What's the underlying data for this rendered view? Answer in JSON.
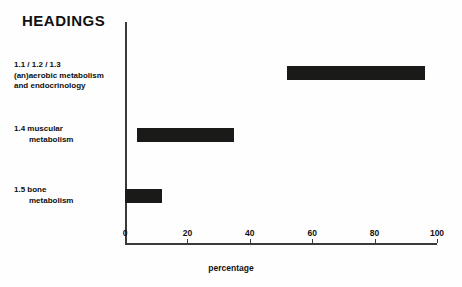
{
  "chart_data": {
    "type": "bar",
    "orientation": "horizontal",
    "title": "HEADINGS",
    "xlabel": "percentage",
    "ylabel": "",
    "xlim": [
      0,
      100
    ],
    "xticks": [
      0,
      20,
      40,
      60,
      80,
      100
    ],
    "xtick_labels": [
      "0",
      "20",
      "40",
      "60",
      "80",
      "100"
    ],
    "grid": false,
    "legend": false,
    "bar_color": "#1a1a18",
    "axis_color": "#3a3a3a",
    "categories": [
      "1.1 / 1.2 / 1.3 (an)aerobic metabolism and endocrinology",
      "1.4 muscular metabolism",
      "1.5 bone metabolism"
    ],
    "ranges": [
      {
        "start": 52,
        "end": 96
      },
      {
        "start": 4,
        "end": 35
      },
      {
        "start": 0,
        "end": 12
      }
    ],
    "values": [
      44,
      31,
      12
    ]
  },
  "chart": {
    "title": "HEADINGS",
    "axis_title": "percentage",
    "categories": [
      {
        "lines": [
          {
            "text": "1.1 / 1.2 / 1.3",
            "indent": false
          },
          {
            "text": "(an)aerobic metabolism",
            "indent": false
          },
          {
            "text": "and endocrinology",
            "indent": false
          }
        ]
      },
      {
        "lines": [
          {
            "text": "1.4 muscular",
            "indent": false
          },
          {
            "text": "metabolism",
            "indent": true
          }
        ]
      },
      {
        "lines": [
          {
            "text": "1.5 bone",
            "indent": false
          },
          {
            "text": "metabolism",
            "indent": true
          }
        ]
      }
    ],
    "ticks": [
      {
        "label": "0",
        "value": 0
      },
      {
        "label": "20",
        "value": 20
      },
      {
        "label": "40",
        "value": 40
      },
      {
        "label": "60",
        "value": 60
      },
      {
        "label": "80",
        "value": 80
      },
      {
        "label": "100",
        "value": 100
      }
    ]
  }
}
